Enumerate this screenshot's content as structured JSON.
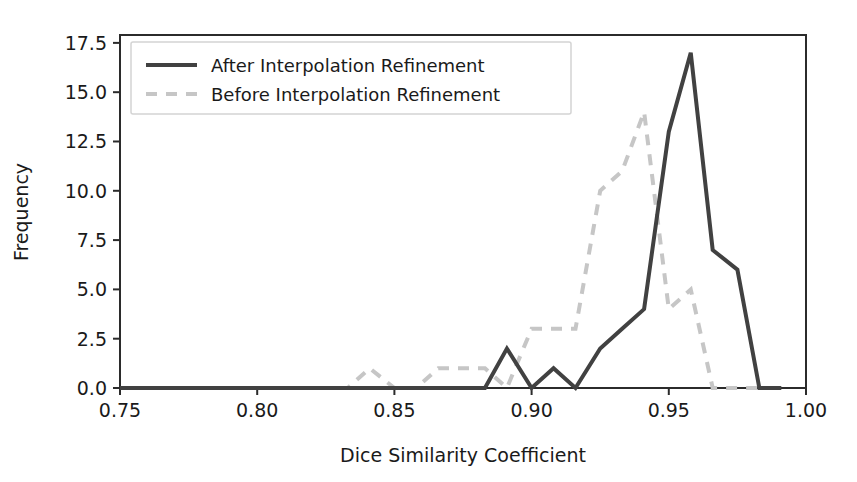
{
  "chart_data": {
    "type": "line",
    "title": "",
    "xlabel": "Dice Similarity Coefficient",
    "ylabel": "Frequency",
    "xlim": [
      0.75,
      1.0
    ],
    "ylim": [
      0.0,
      17.9
    ],
    "grid": false,
    "legend_position": "upper left",
    "xticks": [
      0.75,
      0.8,
      0.85,
      0.9,
      0.95,
      1.0
    ],
    "xtick_labels": [
      "0.75",
      "0.80",
      "0.85",
      "0.90",
      "0.95",
      "1.00"
    ],
    "yticks": [
      0.0,
      2.5,
      5.0,
      7.5,
      10.0,
      12.5,
      15.0,
      17.5
    ],
    "ytick_labels": [
      "0.0",
      "2.5",
      "5.0",
      "7.5",
      "10.0",
      "12.5",
      "15.0",
      "17.5"
    ],
    "series": [
      {
        "name": "After Interpolation Refinement",
        "style": "solid",
        "color": "#414141",
        "x": [
          0.75,
          0.766,
          0.783,
          0.8,
          0.816,
          0.833,
          0.85,
          0.866,
          0.883,
          0.891,
          0.9,
          0.908,
          0.916,
          0.925,
          0.933,
          0.941,
          0.95,
          0.958,
          0.966,
          0.975,
          0.983,
          0.991
        ],
        "values": [
          0,
          0,
          0,
          0,
          0,
          0,
          0,
          0,
          0,
          2,
          0,
          1,
          0,
          2,
          3,
          4,
          13,
          17,
          7,
          6,
          0,
          0
        ]
      },
      {
        "name": "Before Interpolation Refinement",
        "style": "dashed",
        "color": "#c6c6c6",
        "x": [
          0.75,
          0.766,
          0.783,
          0.8,
          0.816,
          0.833,
          0.841,
          0.85,
          0.858,
          0.866,
          0.875,
          0.883,
          0.891,
          0.9,
          0.908,
          0.916,
          0.925,
          0.933,
          0.941,
          0.95,
          0.958,
          0.966,
          0.975,
          0.983,
          0.991
        ],
        "values": [
          0,
          0,
          0,
          0,
          0,
          0,
          1,
          0,
          0,
          1,
          1,
          1,
          0,
          3,
          3,
          3,
          10,
          11,
          14,
          4,
          5,
          0,
          0,
          0,
          0
        ]
      }
    ]
  },
  "legend": {
    "entries": [
      {
        "label": "After Interpolation Refinement"
      },
      {
        "label": "Before Interpolation Refinement"
      }
    ]
  }
}
